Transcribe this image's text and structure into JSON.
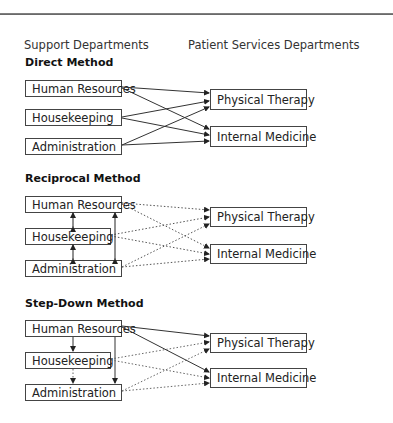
{
  "headers": {
    "support": "Support Departments",
    "patient": "Patient Services Departments"
  },
  "methods": [
    {
      "title": "Direct Method",
      "support_departments": [
        "Human Resources",
        "Housekeeping",
        "Administration"
      ],
      "patient_departments": [
        "Physical Therapy",
        "Internal Medicine"
      ],
      "line_style": "solid"
    },
    {
      "title": "Reciprocal Method",
      "support_departments": [
        "Human Resources",
        "Housekeeping",
        "Administration"
      ],
      "patient_departments": [
        "Physical Therapy",
        "Internal Medicine"
      ],
      "line_style": "dotted"
    },
    {
      "title": "Step-Down Method",
      "support_departments": [
        "Human Resources",
        "Housekeeping",
        "Administration"
      ],
      "patient_departments": [
        "Physical Therapy",
        "Internal Medicine"
      ],
      "line_style": "mixed"
    }
  ],
  "colors": {
    "line": "#333333",
    "dotted": "#555555",
    "border": "#444444"
  }
}
